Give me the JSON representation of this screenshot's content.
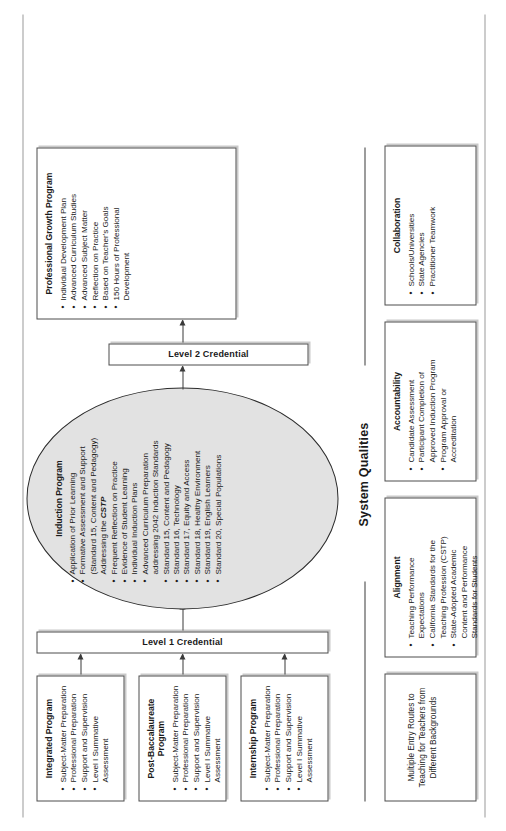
{
  "diagram": {
    "section_label": "System Qualities",
    "level1_label": "Level 1 Credential",
    "level2_label": "Level 2 Credential",
    "preparation_programs": [
      {
        "name": "box-integrated",
        "title": "Integrated Program",
        "bullets": [
          "Subject-Matter Preparation",
          "Professional Preparation",
          "Support and Supervision",
          "Level I Summative Assessment"
        ]
      },
      {
        "name": "box-postbac",
        "title": "Post-Baccalaureate Program",
        "bullets": [
          "Subject-Matter Preparation",
          "Professional Preparation",
          "Support and Supervision",
          "Level I Summative Assessment"
        ]
      },
      {
        "name": "box-internship",
        "title": "Internship Program",
        "bullets": [
          "Subject-Matter Preparation",
          "Professional Preparation",
          "Support and Supervision",
          "Level I Summative Assessment"
        ]
      }
    ],
    "induction": {
      "title": "Induction Program",
      "bullets": [
        "Application of Prior Learning",
        "Formative Assessment and Support",
        "(Standard 15, Content and Pedagogy)",
        "Addressing the CSTP",
        "Frequent Reflection on Practice",
        "Evidence of Student Learning",
        "Individual Induction Plans",
        "Advanced Curriculum Preparation",
        "addressing 2042 Induction Standards",
        "Standard 15, Content and Pedagogy",
        "Standard 16, Technology",
        "Standard 17, Equity and Access",
        "Standard 18, Healthy Environment",
        "Standard 19, English Learners",
        "Standard 20, Special Populations"
      ],
      "emphasis_term": "CSTP"
    },
    "professional_growth": {
      "title": "Professional Growth Program",
      "bullets": [
        "Individual Development Plan",
        "Advanced Curriculum Studies",
        "Advanced Subject Matter",
        "Reflection on Practice",
        "Based on Teacher's Goals",
        "150 Hours of Professional",
        "Development"
      ]
    },
    "system_qualities": [
      {
        "name": "box-entry",
        "title": "",
        "plain_text": "Multiple Entry Routes to Teaching for Teachers from Different Backgrounds",
        "bullets": []
      },
      {
        "name": "box-alignment",
        "title": "Alignment",
        "bullets": [
          "Teaching Performance",
          "Expectations",
          "California Standards for the",
          "Teaching Profession (CSTP)",
          "State-Adopted Academic",
          "Content and Performance",
          "Standards for Students"
        ]
      },
      {
        "name": "box-accountability",
        "title": "Accountability",
        "bullets": [
          "Candidate Assessment",
          "Participant Completion of",
          "Approved Induction Program",
          "Program Approval or",
          "Accreditation"
        ]
      },
      {
        "name": "box-collaboration",
        "title": "Collaboration",
        "bullets": [
          "Schools/Universities",
          "State Agencies",
          "Practitioner Teamwork"
        ]
      }
    ],
    "arrows": [
      "integrated-to-level1",
      "postbac-to-level1",
      "internship-to-level1",
      "level1-to-induction",
      "induction-to-level2",
      "level2-to-professional-growth"
    ],
    "colors": {
      "oval_fill": "#e2e2e2",
      "box_border": "#4d4d4d",
      "box_shadow": "#c9c9c9",
      "text": "#1a1a1a",
      "arrow": "#3a3a3a"
    }
  }
}
